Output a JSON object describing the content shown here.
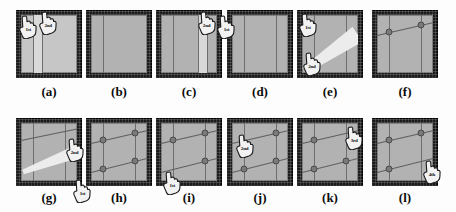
{
  "figure": {
    "name": "sketch-constraint-sequence",
    "panel_count": 12,
    "rows": 2,
    "cols": 6,
    "colors": {
      "frame": "#1b1b1b",
      "canvas": "#b2b2b2",
      "canvas_light": "#c6c6c6",
      "line": "#6e6e6e",
      "line_dark": "#5e5e5e",
      "band": "#d9d9d9",
      "wedge": "#ececec",
      "dot": "#7a7a7a",
      "caption": "#0b0b0b"
    }
  },
  "panels": [
    {
      "id": "a",
      "caption": "(a)",
      "canvas": "light",
      "band": {
        "left_pct": 22,
        "width_pct": 16
      },
      "vlines_pct": [
        22,
        38
      ],
      "dlines": [],
      "dots": [],
      "wedge": null,
      "cursors": [
        {
          "order": "1st",
          "x_pct": 2,
          "y_pct": 8
        },
        {
          "order": "2nd",
          "x_pct": 32,
          "y_pct": 2
        }
      ]
    },
    {
      "id": "b",
      "caption": "(b)",
      "canvas": "normal",
      "band": null,
      "vlines_pct": [
        22
      ],
      "dlines": [],
      "dots": [],
      "wedge": null,
      "cursors": []
    },
    {
      "id": "c",
      "caption": "(c)",
      "canvas": "normal",
      "band": {
        "left_pct": 66,
        "width_pct": 16
      },
      "vlines_pct": [
        22,
        66,
        82
      ],
      "dlines": [],
      "dots": [],
      "wedge": null,
      "cursors": [
        {
          "order": "2nd",
          "x_pct": 60,
          "y_pct": 2
        },
        {
          "order": "1st",
          "x_pct": 90,
          "y_pct": 8
        }
      ]
    },
    {
      "id": "d",
      "caption": "(d)",
      "canvas": "normal",
      "band": null,
      "vlines_pct": [
        22,
        78
      ],
      "dlines": [],
      "dots": [],
      "wedge": null,
      "cursors": []
    },
    {
      "id": "e",
      "caption": "(e)",
      "canvas": "normal",
      "band": null,
      "vlines_pct": [
        22,
        78
      ],
      "dlines": [],
      "dots": [],
      "wedge": {
        "type": "rubber-band-wedge",
        "x1_pct": 4,
        "y1_pct": 78,
        "x2_pct": 98,
        "y2_pct": 16,
        "thick_pct": 34
      },
      "cursors": [
        {
          "order": "1st",
          "x_pct": 0,
          "y_pct": 4
        },
        {
          "order": "2nd",
          "x_pct": 6,
          "y_pct": 62
        }
      ]
    },
    {
      "id": "f",
      "caption": "(f)",
      "canvas": "normal",
      "band": null,
      "vlines_pct": [
        22,
        78
      ],
      "dlines": [
        {
          "x1_pct": 0,
          "y1_pct": 34,
          "x2_pct": 100,
          "y2_pct": 12
        }
      ],
      "dots": [
        {
          "x_pct": 22,
          "y_pct": 29
        },
        {
          "x_pct": 78,
          "y_pct": 17
        }
      ],
      "wedge": null,
      "cursors": []
    },
    {
      "id": "g",
      "caption": "(g)",
      "canvas": "normal",
      "band": null,
      "vlines_pct": [
        22,
        78
      ],
      "dlines": [
        {
          "x1_pct": 0,
          "y1_pct": 30,
          "x2_pct": 100,
          "y2_pct": 10
        }
      ],
      "dots": [],
      "wedge": {
        "type": "rubber-band-wedge",
        "x1_pct": 2,
        "y1_pct": 72,
        "x2_pct": 90,
        "y2_pct": 40,
        "thick_pct": 22
      },
      "cursors": [
        {
          "order": "2nd",
          "x_pct": 72,
          "y_pct": 30
        },
        {
          "order": "1st",
          "x_pct": 84,
          "y_pct": 90
        }
      ]
    },
    {
      "id": "h",
      "caption": "(h)",
      "canvas": "normal",
      "band": null,
      "vlines_pct": [
        22,
        78
      ],
      "dlines": [
        {
          "x1_pct": 0,
          "y1_pct": 34,
          "x2_pct": 100,
          "y2_pct": 12
        },
        {
          "x1_pct": 0,
          "y1_pct": 84,
          "x2_pct": 100,
          "y2_pct": 60
        }
      ],
      "dots": [
        {
          "x_pct": 22,
          "y_pct": 29
        },
        {
          "x_pct": 78,
          "y_pct": 17
        },
        {
          "x_pct": 22,
          "y_pct": 79
        },
        {
          "x_pct": 78,
          "y_pct": 65
        }
      ],
      "wedge": null,
      "cursors": []
    },
    {
      "id": "i",
      "caption": "(i)",
      "canvas": "normal",
      "band": null,
      "vlines_pct": [
        22,
        78
      ],
      "dlines": [
        {
          "x1_pct": 0,
          "y1_pct": 34,
          "x2_pct": 100,
          "y2_pct": 12
        },
        {
          "x1_pct": 0,
          "y1_pct": 84,
          "x2_pct": 100,
          "y2_pct": 60
        }
      ],
      "dots": [
        {
          "x_pct": 22,
          "y_pct": 29
        },
        {
          "x_pct": 78,
          "y_pct": 17
        },
        {
          "x_pct": 78,
          "y_pct": 65
        }
      ],
      "wedge": null,
      "cursors": [
        {
          "order": "1st",
          "x_pct": 8,
          "y_pct": 78
        }
      ]
    },
    {
      "id": "j",
      "caption": "(j)",
      "canvas": "normal",
      "band": null,
      "vlines_pct": [
        22,
        78
      ],
      "dlines": [
        {
          "x1_pct": 0,
          "y1_pct": 34,
          "x2_pct": 100,
          "y2_pct": 12
        },
        {
          "x1_pct": 0,
          "y1_pct": 84,
          "x2_pct": 100,
          "y2_pct": 60
        }
      ],
      "dots": [
        {
          "x_pct": 78,
          "y_pct": 17
        },
        {
          "x_pct": 22,
          "y_pct": 79
        },
        {
          "x_pct": 78,
          "y_pct": 65
        }
      ],
      "wedge": null,
      "cursors": [
        {
          "order": "2nd",
          "x_pct": 10,
          "y_pct": 24
        }
      ]
    },
    {
      "id": "k",
      "caption": "(k)",
      "canvas": "normal",
      "band": null,
      "vlines_pct": [
        22,
        78
      ],
      "dlines": [
        {
          "x1_pct": 0,
          "y1_pct": 34,
          "x2_pct": 100,
          "y2_pct": 12
        },
        {
          "x1_pct": 0,
          "y1_pct": 84,
          "x2_pct": 100,
          "y2_pct": 60
        }
      ],
      "dots": [
        {
          "x_pct": 22,
          "y_pct": 29
        },
        {
          "x_pct": 22,
          "y_pct": 79
        },
        {
          "x_pct": 78,
          "y_pct": 65
        }
      ],
      "wedge": null,
      "cursors": [
        {
          "order": "3rd",
          "x_pct": 70,
          "y_pct": 12
        }
      ]
    },
    {
      "id": "l",
      "caption": "(l)",
      "canvas": "normal",
      "band": null,
      "vlines_pct": [
        22,
        78
      ],
      "dlines": [
        {
          "x1_pct": 0,
          "y1_pct": 34,
          "x2_pct": 100,
          "y2_pct": 12
        },
        {
          "x1_pct": 0,
          "y1_pct": 84,
          "x2_pct": 100,
          "y2_pct": 60
        }
      ],
      "dots": [
        {
          "x_pct": 22,
          "y_pct": 29
        },
        {
          "x_pct": 78,
          "y_pct": 17
        },
        {
          "x_pct": 22,
          "y_pct": 79
        }
      ],
      "wedge": null,
      "cursors": [
        {
          "order": "4th",
          "x_pct": 74,
          "y_pct": 62
        }
      ]
    }
  ],
  "layout": {
    "row_tops": [
      10,
      118
    ],
    "panel_w": 66,
    "panel_h": 68,
    "col_lefts": [
      16,
      86,
      156,
      227,
      297,
      372
    ],
    "caption_tops": [
      84,
      190
    ]
  }
}
